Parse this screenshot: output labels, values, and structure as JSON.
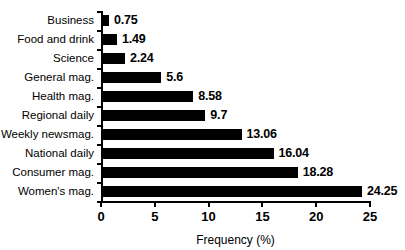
{
  "chart_data": {
    "type": "bar",
    "orientation": "horizontal",
    "title": "",
    "xlabel": "Frequency (%)",
    "ylabel": "",
    "xlim": [
      0,
      25
    ],
    "xticks": [
      "0",
      "5",
      "10",
      "15",
      "20",
      "25"
    ],
    "grid": false,
    "legend": null,
    "bar_color": "#000000",
    "background_color": "#ffffff",
    "categories": [
      "Business",
      "Food and drink",
      "Science",
      "General mag.",
      "Health mag.",
      "Regional daily",
      "Weekly newsmag.",
      "National daily",
      "Consumer mag.",
      "Women's mag."
    ],
    "values": [
      0.75,
      1.49,
      2.24,
      5.6,
      8.58,
      9.7,
      13.06,
      16.04,
      18.28,
      24.25
    ],
    "value_labels": [
      "0.75",
      "1.49",
      "2.24",
      "5.6",
      "8.58",
      "9.7",
      "13.06",
      "16.04",
      "18.28",
      "24.25"
    ]
  }
}
